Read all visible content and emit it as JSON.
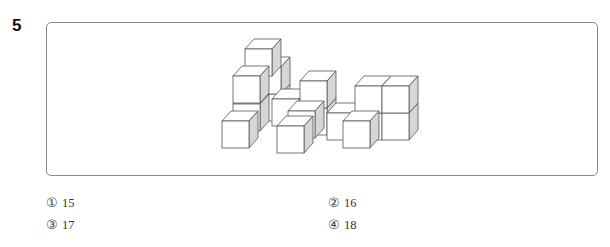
{
  "question": {
    "number": "5"
  },
  "figure": {
    "colors": {
      "stroke": "#555555",
      "face": "#ffffff",
      "side_shade": "#d6d6d6"
    }
  },
  "options": [
    {
      "mark": "①",
      "value": "15"
    },
    {
      "mark": "②",
      "value": "16"
    },
    {
      "mark": "③",
      "value": "17"
    },
    {
      "mark": "④",
      "value": "18"
    }
  ]
}
